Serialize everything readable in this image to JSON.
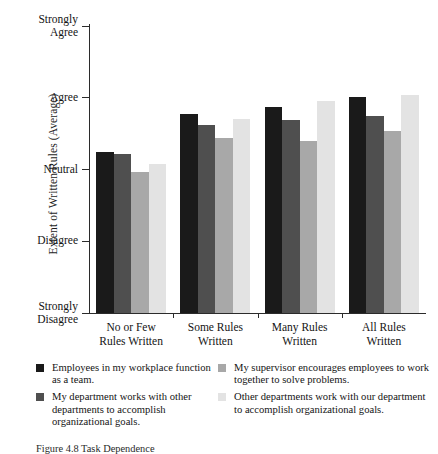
{
  "chart_data": {
    "type": "bar",
    "title": "",
    "xlabel": "",
    "ylabel": "Extent of Written Rules (Average)",
    "categories": [
      "No or Few\nRules Written",
      "Some Rules\nWritten",
      "Many Rules\nWritten",
      "All Rules\nWritten"
    ],
    "ytick_labels": [
      "Strongly\nAgree",
      "Agree",
      "Neutral",
      "Disagree",
      "Strongly\nDisagree"
    ],
    "ytick_values": [
      5,
      4,
      3,
      2,
      1
    ],
    "ylim": [
      1,
      5
    ],
    "grid": false,
    "legend_position": "bottom",
    "series": [
      {
        "name": "Employees in my workplace function as a team.",
        "color": "#1a1a1a",
        "values": [
          3.24,
          3.77,
          3.87,
          4.01
        ]
      },
      {
        "name": "My department works with other departments to accomplish organizational goals.",
        "color": "#4f4f4f",
        "values": [
          3.21,
          3.62,
          3.69,
          3.75
        ]
      },
      {
        "name": "My supervisor encourages employees to work together to solve problems.",
        "color": "#a8a8a8",
        "values": [
          2.96,
          3.44,
          3.4,
          3.54
        ]
      },
      {
        "name": "Other departments work with our department to accomplish organizational goals.",
        "color": "#e3e3e3",
        "values": [
          3.07,
          3.7,
          3.95,
          4.04
        ]
      }
    ]
  },
  "axis": {
    "y_title": "Extent of Written Rules (Average)",
    "ticks": [
      {
        "label": "Strongly\nAgree",
        "value": 5
      },
      {
        "label": "Agree",
        "value": 4
      },
      {
        "label": "Neutral",
        "value": 3
      },
      {
        "label": "Disagree",
        "value": 2
      },
      {
        "label": "Strongly\nDisagree",
        "value": 1
      }
    ]
  },
  "groups": [
    {
      "label": "No or Few\nRules Written"
    },
    {
      "label": "Some Rules\nWritten"
    },
    {
      "label": "Many Rules\nWritten"
    },
    {
      "label": "All Rules\nWritten"
    }
  ],
  "legend": {
    "left": [
      {
        "label": "Employees in my workplace function as a team.",
        "color": "#1a1a1a"
      },
      {
        "label": "My department works with other departments to accomplish organizational goals.",
        "color": "#4f4f4f"
      }
    ],
    "right": [
      {
        "label": "My supervisor encourages employees to work together to solve problems.",
        "color": "#a8a8a8"
      },
      {
        "label": "Other departments work with our department to accomplish organizational goals.",
        "color": "#e3e3e3"
      }
    ]
  },
  "caption": "Figure 4.8   Task Dependence"
}
